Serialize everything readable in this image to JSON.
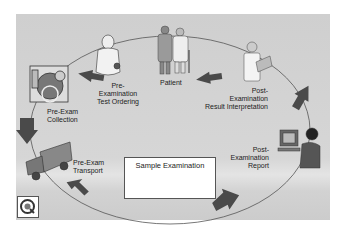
{
  "diagram": {
    "type": "cycle",
    "stages": [
      {
        "id": "patient",
        "label": "Patient"
      },
      {
        "id": "test-ordering",
        "label": "Pre-\nExamination\nTest Ordering"
      },
      {
        "id": "collection",
        "label": "Pre-Exam\nCollection"
      },
      {
        "id": "transport",
        "label": "Pre-Exam\nTransport"
      },
      {
        "id": "sample-exam",
        "label": "Sample Examination"
      },
      {
        "id": "report",
        "label": "Post-\nExamination\nReport"
      },
      {
        "id": "interpretation",
        "label": "Post-\nExamination\nResult Interpretation"
      }
    ],
    "labels": {
      "patient": "Patient",
      "ordering_1": "Pre-",
      "ordering_2": "Examination",
      "ordering_3": "Test Ordering",
      "collection_1": "Pre-Exam",
      "collection_2": "Collection",
      "transport_1": "Pre-Exam",
      "transport_2": "Transport",
      "sample": "Sample Examination",
      "report_1": "Post-",
      "report_2": "Examination",
      "report_3": "Report",
      "interp_1": "Post-",
      "interp_2": "Examination",
      "interp_3": "Result Interpretation"
    },
    "colors": {
      "background": "#d3d3d3",
      "arrow": "#4a4a4a",
      "cycle_line": "#555555"
    }
  }
}
